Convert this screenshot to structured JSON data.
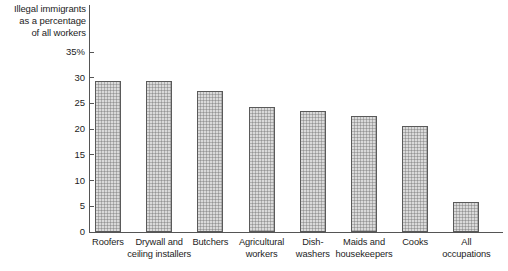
{
  "chart_data": {
    "type": "bar",
    "title": "Illegal immigrants as a percentage of all workers",
    "title_lines": [
      "Illegal immigrants",
      "as a percentage",
      "of all workers"
    ],
    "xlabel": "",
    "ylabel": "",
    "ylim": [
      0,
      35
    ],
    "grid": false,
    "legend": "none",
    "ytick_labels": [
      "35%",
      "30",
      "25",
      "20",
      "15",
      "10",
      "5",
      "0"
    ],
    "ytick_values": [
      35,
      30,
      25,
      20,
      15,
      10,
      5,
      0
    ],
    "categories": [
      "Roofers",
      "Drywall and ceiling installers",
      "Butchers",
      "Agricultural workers",
      "Dish-washers",
      "Maids and housekeepers",
      "Cooks",
      "All occupations"
    ],
    "category_lines": [
      [
        "Roofers"
      ],
      [
        "Drywall and",
        "ceiling installers"
      ],
      [
        "Butchers"
      ],
      [
        "Agricultural",
        "workers"
      ],
      [
        "Dish-",
        "washers"
      ],
      [
        "Maids and",
        "housekeepers"
      ],
      [
        "Cooks"
      ],
      [
        "All",
        "occupations"
      ]
    ],
    "values": [
      29.3,
      29.4,
      27.4,
      24.4,
      23.5,
      22.5,
      20.6,
      5.9
    ],
    "bar_fill_color": "#b0b0b0",
    "bar_edge_color": "#5a5a5a",
    "axis_color": "#555555",
    "text_color": "#1d1d1d"
  }
}
